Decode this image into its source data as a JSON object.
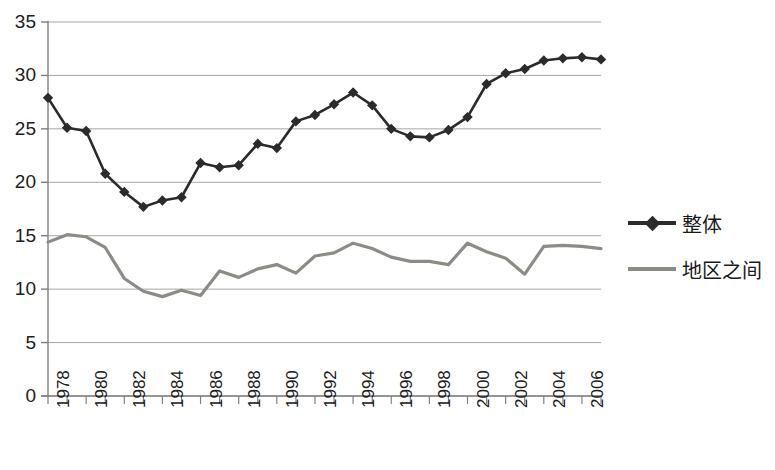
{
  "chart_data": {
    "type": "line",
    "title": "",
    "xlabel": "",
    "ylabel": "",
    "ylim": [
      0,
      35
    ],
    "ytick_values": [
      0,
      5,
      10,
      15,
      20,
      25,
      30,
      35
    ],
    "ytick_labels": [
      "0",
      "5",
      "10",
      "15",
      "20",
      "25",
      "30",
      "35"
    ],
    "grid": true,
    "legend_position": "right",
    "x": [
      1978,
      1979,
      1980,
      1981,
      1982,
      1983,
      1984,
      1985,
      1986,
      1987,
      1988,
      1989,
      1990,
      1991,
      1992,
      1993,
      1994,
      1995,
      1996,
      1997,
      1998,
      1999,
      2000,
      2001,
      2002,
      2003,
      2004,
      2005,
      2006,
      2007
    ],
    "xtick_labels": [
      "1978",
      "1980",
      "1982",
      "1984",
      "1986",
      "1988",
      "1990",
      "1992",
      "1994",
      "1996",
      "1998",
      "2000",
      "2002",
      "2004",
      "2006"
    ],
    "xtick_values": [
      1978,
      1980,
      1982,
      1984,
      1986,
      1988,
      1990,
      1992,
      1994,
      1996,
      1998,
      2000,
      2002,
      2004,
      2006
    ],
    "series": [
      {
        "name": "整体",
        "color": "#2b2b2b",
        "marker": "diamond",
        "values": [
          27.9,
          25.1,
          24.8,
          20.8,
          19.1,
          17.7,
          18.3,
          18.6,
          21.8,
          21.4,
          21.6,
          23.6,
          23.2,
          25.7,
          26.3,
          27.3,
          28.4,
          27.2,
          25.0,
          24.3,
          24.2,
          24.9,
          26.1,
          29.2,
          30.2,
          30.6,
          31.4,
          31.6,
          31.7,
          31.5
        ]
      },
      {
        "name": "地区之间",
        "color": "#8c8c87",
        "marker": "none",
        "values": [
          14.4,
          15.1,
          14.9,
          13.9,
          11.0,
          9.8,
          9.3,
          9.9,
          9.4,
          11.7,
          11.1,
          11.9,
          12.3,
          11.5,
          13.1,
          13.4,
          14.3,
          13.8,
          13.0,
          12.6,
          12.6,
          12.3,
          14.3,
          13.5,
          12.9,
          11.4,
          14.0,
          14.1,
          14.0,
          13.8
        ]
      }
    ]
  },
  "legend": {
    "items": [
      {
        "label": "整体",
        "color": "#2b2b2b",
        "marker": "diamond"
      },
      {
        "label": "地区之间",
        "color": "#8c8c87",
        "marker": "none"
      }
    ]
  },
  "plot": {
    "left": 48,
    "right": 601,
    "top": 22,
    "bottom": 396,
    "axis_color": "#808080",
    "grid_color": "#a6a6a6"
  }
}
